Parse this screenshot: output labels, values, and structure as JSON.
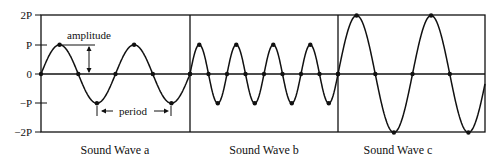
{
  "axis": {
    "y_ticks": [
      "2P",
      "P",
      "0",
      "−P",
      "−2P"
    ],
    "y_values": [
      2,
      1,
      0,
      -1,
      -2
    ]
  },
  "annotations": {
    "amplitude": "amplitude",
    "period": "period"
  },
  "panels": [
    {
      "caption": "Sound Wave a",
      "amplitude": 1,
      "cycles": 2,
      "description": "amplitude P, 2 full cycles"
    },
    {
      "caption": "Sound Wave b",
      "amplitude": 1,
      "cycles": 4,
      "description": "amplitude P, higher frequency (about 4 cycles)"
    },
    {
      "caption": "Sound Wave c",
      "amplitude": 2,
      "cycles": 2,
      "description": "amplitude 2P, 2 full cycles"
    }
  ],
  "colors": {
    "line": "#111111",
    "background": "#ffffff"
  }
}
